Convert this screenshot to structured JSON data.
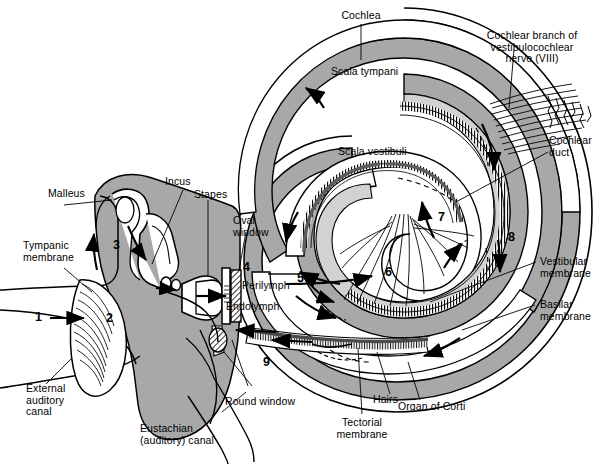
{
  "diagram": {
    "background_color": "#ffffff",
    "ink_color": "#000000",
    "tissue_fill": "#a8a8a8",
    "light_fill": "#d0d0d0",
    "dark_band": "#5a5a5a",
    "lumen_fill": "#ffffff"
  },
  "labels": {
    "cochlea": "Cochlea",
    "scala_tympani": "Scala tympani",
    "scala_vestibuli": "Scala vestibuli",
    "cochlear_nerve": "Cochlear branch of\nvestibulocochlear\nnerve (VIII)",
    "cochlear_duct": "Cochlear\nduct",
    "vestibular_membrane": "Vestibular\nmembrane",
    "basilar_membrane": "Basilar\nmembrane",
    "organ_of_corti": "Organ of Corti",
    "hairs": "Hairs",
    "tectorial_membrane": "Tectorial\nmembrane",
    "round_window": "Round window",
    "oval_window": "Oval\nwindow",
    "perilymph": "Perilymph",
    "endolymph": "Endolymph",
    "malleus": "Malleus",
    "incus": "Incus",
    "stapes": "Stapes",
    "tympanic_membrane": "Tympanic\nmembrane",
    "external_auditory_canal": "External\nauditory\ncanal",
    "eustachian_canal": "Eustachian\n(auditory) canal"
  },
  "step_numbers": {
    "n1": "1",
    "n2": "2",
    "n3": "3",
    "n4": "4",
    "n5": "5",
    "n6": "6",
    "n7": "7",
    "n8": "8",
    "n9": "9"
  }
}
